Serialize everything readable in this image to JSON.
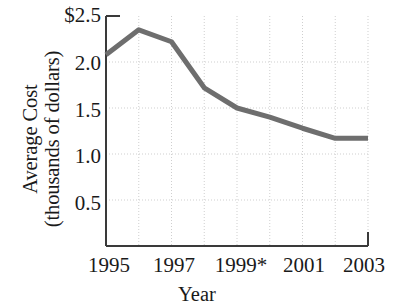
{
  "chart_data": {
    "type": "line",
    "title": "",
    "subtitle": "",
    "xlabel": "Year",
    "ylabel": "Average Cost (thousands of dollars)",
    "ylabel_line1": "Average Cost",
    "ylabel_line2": "(thousands of dollars)",
    "x": [
      1995,
      1996,
      1997,
      1998,
      1999,
      2000,
      2001,
      2002,
      2003
    ],
    "values": [
      2.08,
      2.35,
      2.22,
      1.72,
      1.5,
      1.4,
      1.28,
      1.17,
      1.17
    ],
    "series": [
      {
        "name": "Average Cost",
        "values": [
          2.08,
          2.35,
          2.22,
          1.72,
          1.5,
          1.4,
          1.28,
          1.17,
          1.17
        ]
      }
    ],
    "xlim": [
      1995,
      2003
    ],
    "ylim": [
      0,
      2.5
    ],
    "ytick_values": [
      2.5,
      2.0,
      1.5,
      1.0,
      0.5
    ],
    "ytick_labels": [
      "$2.5",
      "2.0",
      "1.5",
      "1.0",
      "0.5"
    ],
    "xtick_values": [
      1995,
      1997,
      1999,
      2001,
      2003
    ],
    "xtick_labels": [
      "1995",
      "1997",
      "1999*",
      "2001",
      "2003"
    ],
    "grid": true,
    "grid_style": "dotted",
    "legend": false,
    "legend_position": "none",
    "line_color": "#6e6e6e",
    "grid_color": "#cfcfcf",
    "axis_color": "#3a3a3a",
    "background_color": "#ffffff",
    "annotations": [
      "* appended to 1999 tick label"
    ]
  }
}
